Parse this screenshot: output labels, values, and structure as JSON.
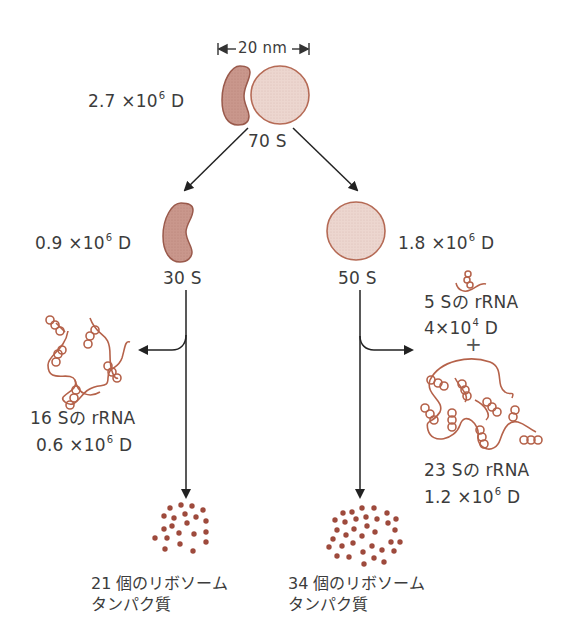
{
  "diagram": {
    "type": "ribosome-structure",
    "colors": {
      "small_subunit_fill": "#c9978c",
      "small_subunit_stroke": "#9a5a4c",
      "large_subunit_fill": "#ead3cc",
      "large_subunit_stroke": "#b56a55",
      "rrna_strand": "#b5624a",
      "protein_dot": "#9e4a3c",
      "arrow": "#222222",
      "text": "#3c3c3c"
    },
    "scale_bar": {
      "label": "20 nm"
    },
    "ribosome_70s": {
      "label": "70 S",
      "mass_prefix": "2.7 ×10",
      "mass_exp": "6",
      "mass_unit": "D"
    },
    "subunit_30s": {
      "label": "30 S",
      "mass_prefix": "0.9 ×10",
      "mass_exp": "6",
      "mass_unit": "D",
      "rrna": {
        "name": "16 Sの rRNA",
        "mass_prefix": "0.6 ×10",
        "mass_exp": "6",
        "mass_unit": "D"
      },
      "proteins": {
        "line1": "21 個のリボソーム",
        "line2": "タンパク質",
        "count": 21
      }
    },
    "subunit_50s": {
      "label": "50 S",
      "mass_prefix": "1.8 ×10",
      "mass_exp": "6",
      "mass_unit": "D",
      "rrna_5s": {
        "name": "5 Sの rRNA",
        "mass_prefix": "4×10",
        "mass_exp": "4",
        "mass_unit": "D"
      },
      "plus": "+",
      "rrna_23s": {
        "name": "23 Sの rRNA",
        "mass_prefix": "1.2 ×10",
        "mass_exp": "6",
        "mass_unit": "D"
      },
      "proteins": {
        "line1": "34 個のリボソーム",
        "line2": "タンパク質",
        "count": 34
      }
    }
  }
}
